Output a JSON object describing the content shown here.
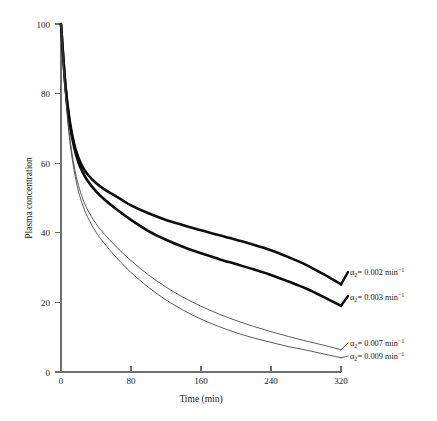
{
  "chart_data": {
    "type": "line",
    "title": "",
    "xlabel": "Time (min)",
    "ylabel": "Plasma concentration",
    "xlim": [
      0,
      320
    ],
    "ylim": [
      0,
      100
    ],
    "xticks": [
      0,
      80,
      160,
      240,
      320
    ],
    "yticks": [
      0,
      20,
      40,
      60,
      80,
      100
    ],
    "xtick_labels": [
      "0",
      "80",
      "160",
      "240",
      "320"
    ],
    "ytick_labels": [
      "0",
      "20",
      "40",
      "60",
      "80",
      "100"
    ],
    "grid": false,
    "legend_position": "right-inline-annotations",
    "x": [
      0,
      5,
      10,
      15,
      20,
      25,
      30,
      40,
      50,
      60,
      70,
      80,
      100,
      120,
      140,
      160,
      180,
      200,
      220,
      240,
      260,
      280,
      300,
      320
    ],
    "series": [
      {
        "name": "alpha2 = 0.002 min^-1",
        "label_text": "= 0.002 min",
        "label_symbol": "α",
        "label_subscript": "2",
        "label_superscript": "−1",
        "alpha2": 0.002,
        "style": "thick",
        "color": "#0d0d0d",
        "values": [
          100,
          82.6,
          72.1,
          65.6,
          61.5,
          58.8,
          56.9,
          54.3,
          52.4,
          50.9,
          49.4,
          47.9,
          45.6,
          43.7,
          42.2,
          40.7,
          39.4,
          38.0,
          36.6,
          35.0,
          33.0,
          30.8,
          28.1,
          25.2
        ]
      },
      {
        "name": "alpha2 = 0.003 min^-1",
        "label_text": "= 0.003 min",
        "label_symbol": "α",
        "label_subscript": "2",
        "label_superscript": "−1",
        "alpha2": 0.003,
        "style": "thick",
        "color": "#0d0d0d",
        "values": [
          100,
          82.3,
          71.4,
          64.6,
          60.2,
          57.3,
          55.1,
          51.9,
          49.5,
          47.4,
          45.5,
          43.7,
          40.5,
          38.0,
          35.9,
          34.1,
          32.5,
          31.0,
          29.5,
          27.9,
          26.0,
          24.0,
          21.6,
          19.0
        ]
      },
      {
        "name": "alpha2 = 0.007 min^-1",
        "label_text": "= 0.007 min",
        "label_symbol": "α",
        "label_subscript": "2",
        "label_superscript": "−1",
        "alpha2": 0.007,
        "style": "thin",
        "color": "#3c3c3c",
        "values": [
          100,
          80.5,
          67.6,
          59.2,
          53.6,
          49.7,
          46.8,
          42.6,
          39.5,
          36.8,
          34.3,
          32.0,
          27.9,
          24.4,
          21.4,
          18.9,
          16.7,
          14.8,
          13.1,
          11.6,
          10.2,
          8.9,
          7.7,
          6.4
        ]
      },
      {
        "name": "alpha2 = 0.009 min^-1",
        "label_text": "= 0.009 min",
        "label_symbol": "α",
        "label_subscript": "2",
        "label_superscript": "−1",
        "alpha2": 0.009,
        "style": "thin",
        "color": "#3c3c3c",
        "values": [
          100,
          80.0,
          66.6,
          57.9,
          51.9,
          47.8,
          44.7,
          40.2,
          36.8,
          33.8,
          31.1,
          28.6,
          24.3,
          20.7,
          17.7,
          15.2,
          13.1,
          11.3,
          9.8,
          8.5,
          7.3,
          6.3,
          5.2,
          4.1
        ]
      }
    ]
  },
  "annotations": {
    "items": [
      {
        "id": "a-0002",
        "symbol": "α",
        "sub": "2",
        "text": "= 0.002 min",
        "sup": "−1"
      },
      {
        "id": "a-0003",
        "symbol": "α",
        "sub": "2",
        "text": "= 0.003 min",
        "sup": "−1"
      },
      {
        "id": "a-0007",
        "symbol": "α",
        "sub": "2",
        "text": "= 0.007 min",
        "sup": "−1"
      },
      {
        "id": "a-0009",
        "symbol": "α",
        "sub": "2",
        "text": "= 0.009 min",
        "sup": "−1"
      }
    ]
  },
  "colors": {
    "background": "#ffffff",
    "axis": "#6e6e6e",
    "thick_curve": "#0d0d0d",
    "thin_curve": "#3c3c3c",
    "text": "#1a1a1a"
  }
}
